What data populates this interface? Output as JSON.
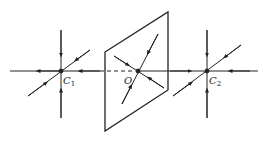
{
  "diagram": {
    "type": "phase-portrait-saddle-focus-schematic",
    "colors": {
      "stroke": "#222222",
      "background": "#ffffff"
    },
    "points": [
      {
        "id": "C1",
        "label": "C",
        "subscript": "1",
        "x": 61,
        "y": 71
      },
      {
        "id": "O",
        "label": "O",
        "subscript": "",
        "x": 138,
        "y": 71
      },
      {
        "id": "C2",
        "label": "C",
        "subscript": "2",
        "x": 207,
        "y": 71
      }
    ],
    "plane": {
      "shape": "parallelogram",
      "corners": [
        [
          105,
          52
        ],
        [
          168,
          12
        ],
        [
          168,
          90
        ],
        [
          105,
          131
        ]
      ]
    },
    "axis": {
      "y": 71,
      "x_start": 10,
      "x_end": 258,
      "dashed_from": 100,
      "dashed_to": 134
    }
  }
}
